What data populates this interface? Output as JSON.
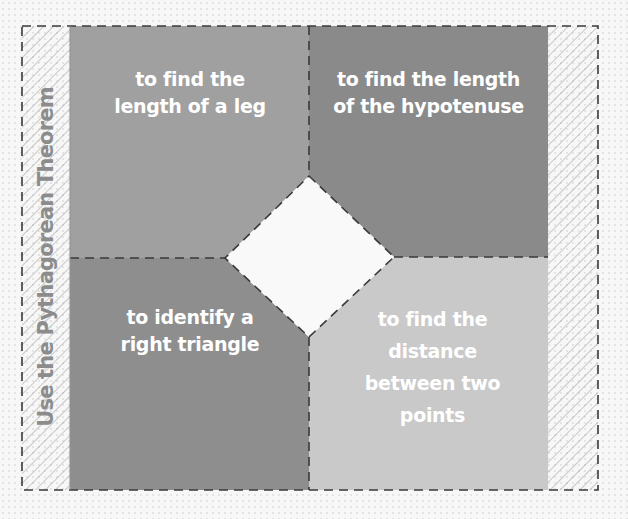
{
  "side_title": "Use the Pythagorean Theorem",
  "quadrants": [
    {
      "position": "top-left",
      "text": "to find the length of a leg",
      "lines": [
        "to find the",
        "length of a leg"
      ],
      "color": "#a0a0a0"
    },
    {
      "position": "top-right",
      "text": "to find the length of the hypotenuse",
      "lines": [
        "to find the length",
        "of the hypotenuse"
      ],
      "color": "#8a8a8a"
    },
    {
      "position": "bottom-left",
      "text": "to identify a right triangle",
      "lines": [
        "to identify a",
        "right triangle"
      ],
      "color": "#8e8e8e"
    },
    {
      "position": "bottom-right",
      "text": "to find the distance between two points",
      "lines": [
        "to find the",
        "distance",
        "between two",
        "points"
      ],
      "color": "#c9c9c9"
    }
  ],
  "colors": {
    "background": "#f7f7f7",
    "dash": "#3a3a3a",
    "hatch": "#9a9a9a",
    "title": "#8c8c8c"
  }
}
